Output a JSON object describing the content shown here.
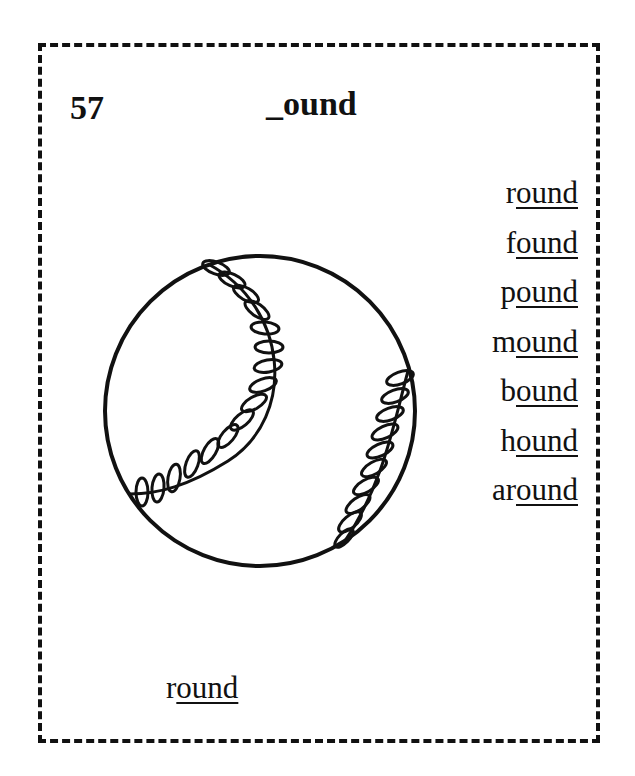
{
  "card": {
    "number": "57",
    "title": "_ound",
    "word_list": [
      {
        "prefix": "r",
        "suffix": "ound"
      },
      {
        "prefix": "f",
        "suffix": "ound"
      },
      {
        "prefix": "p",
        "suffix": "ound"
      },
      {
        "prefix": "m",
        "suffix": "ound"
      },
      {
        "prefix": "b",
        "suffix": "ound"
      },
      {
        "prefix": "h",
        "suffix": "ound"
      },
      {
        "prefix": "ar",
        "suffix": "ound"
      }
    ],
    "answer": {
      "prefix": "r",
      "suffix": "ound"
    },
    "illustration": "baseball-icon"
  }
}
